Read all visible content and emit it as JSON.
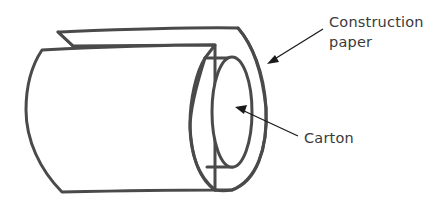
{
  "diagram": {
    "labels": {
      "construction_paper": {
        "line1": "Construction",
        "line2": "paper"
      },
      "carton": "Carton"
    },
    "colors": {
      "stroke": "#4a4a4a",
      "arrow": "#1a1a1a",
      "text": "#3a3a3a",
      "background": "#ffffff"
    }
  }
}
